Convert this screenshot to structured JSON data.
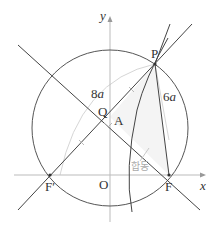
{
  "diagram": {
    "labels": {
      "y_axis": "y",
      "x_axis": "x",
      "origin": "O",
      "P": "P",
      "Q": "Q",
      "A": "A",
      "F": "F",
      "F_prime": "F′",
      "len_8a_num": "8",
      "len_8a_var": "a",
      "len_6a_num": "6",
      "len_6a_var": "a",
      "congruent": "합동"
    },
    "colors": {
      "line": "#444444",
      "axis": "#bbbbbb",
      "guide": "#cccccc",
      "shade": "#f3f3f3",
      "annotation": "#aaaaaa"
    }
  }
}
